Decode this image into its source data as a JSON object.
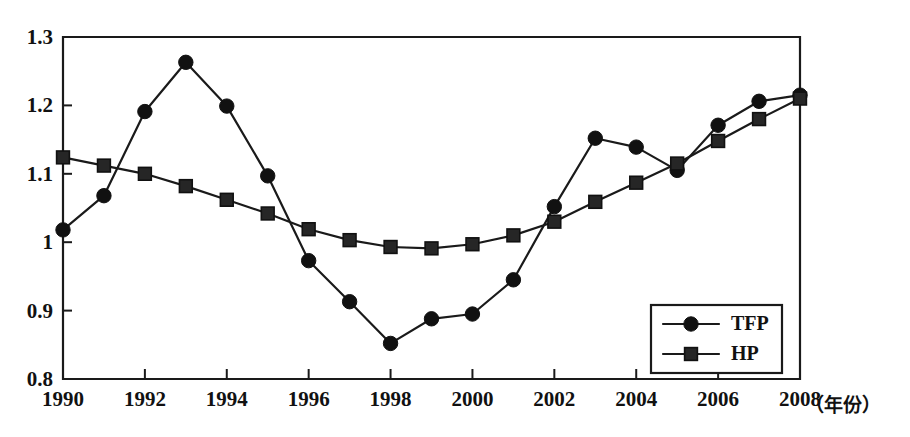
{
  "chart_data": {
    "type": "line",
    "title": "",
    "subtitle": "",
    "xlabel": "（年份）",
    "ylabel": "",
    "x": [
      1990,
      1991,
      1992,
      1993,
      1994,
      1995,
      1996,
      1997,
      1998,
      1999,
      2000,
      2001,
      2002,
      2003,
      2004,
      2005,
      2006,
      2007,
      2008
    ],
    "xlim": [
      1990,
      2008
    ],
    "ylim": [
      0.8,
      1.3
    ],
    "x_tick_labels": [
      "1990",
      "1992",
      "1994",
      "1996",
      "1998",
      "2000",
      "2002",
      "2004",
      "2006",
      "2008"
    ],
    "x_tick_values": [
      1990,
      1992,
      1994,
      1996,
      1998,
      2000,
      2002,
      2004,
      2006,
      2008
    ],
    "y_tick_labels": [
      "0.8",
      "0.9",
      "1",
      "1.1",
      "1.2",
      "1.3"
    ],
    "y_tick_values": [
      0.8,
      0.9,
      1.0,
      1.1,
      1.2,
      1.3
    ],
    "grid": false,
    "legend_position": "bottom-right",
    "series": [
      {
        "name": "TFP",
        "marker": "circle",
        "color": "#111111",
        "values": [
          1.018,
          1.068,
          1.191,
          1.263,
          1.199,
          1.097,
          0.973,
          0.913,
          0.852,
          0.888,
          0.895,
          0.945,
          1.052,
          1.152,
          1.139,
          1.105,
          1.171,
          1.206,
          1.215
        ]
      },
      {
        "name": "HP",
        "marker": "square",
        "color": "#262626",
        "values": [
          1.124,
          1.112,
          1.1,
          1.082,
          1.062,
          1.042,
          1.019,
          1.003,
          0.993,
          0.991,
          0.997,
          1.01,
          1.03,
          1.059,
          1.087,
          1.115,
          1.148,
          1.18,
          1.21
        ]
      }
    ]
  },
  "legend": {
    "entries": [
      {
        "label": "TFP",
        "marker": "circle"
      },
      {
        "label": "HP",
        "marker": "square"
      }
    ]
  },
  "axis_caption": "（年份）"
}
